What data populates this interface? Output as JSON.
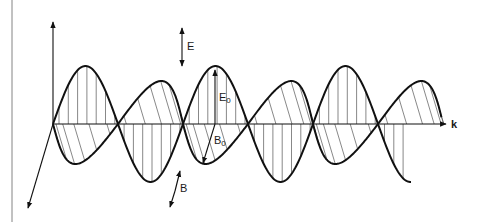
{
  "diagram": {
    "labels": {
      "electric_field": "E",
      "magnetic_field": "B",
      "wave_vector": "k",
      "e_amplitude_main": "E",
      "e_amplitude_sub": "0",
      "b_amplitude_main": "B",
      "b_amplitude_sub": "0"
    },
    "geometry": {
      "origin": [
        53,
        124
      ],
      "axis_end_x": 447,
      "node_spacing": 65,
      "e_amplitude": 58,
      "b_amplitude_up": 43,
      "b_amplitude_down": 40,
      "e_end_x": 411,
      "b_end_x": 440
    },
    "colors": {
      "stroke": "#111111",
      "hatch": "#555555",
      "background": "#ffffff"
    }
  }
}
